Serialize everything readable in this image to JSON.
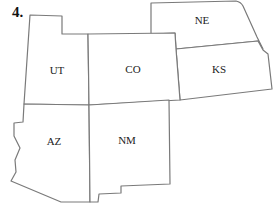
{
  "problem": {
    "number_label": "4."
  },
  "map": {
    "stroke_color": "#7a7a7a",
    "fill_color": "#ffffff",
    "states": [
      {
        "abbr": "UT",
        "label_x": 57,
        "label_y": 74
      },
      {
        "abbr": "CO",
        "label_x": 133,
        "label_y": 73
      },
      {
        "abbr": "NE",
        "label_x": 202,
        "label_y": 24
      },
      {
        "abbr": "KS",
        "label_x": 219,
        "label_y": 73
      },
      {
        "abbr": "AZ",
        "label_x": 54,
        "label_y": 145
      },
      {
        "abbr": "NM",
        "label_x": 127,
        "label_y": 144
      }
    ]
  }
}
